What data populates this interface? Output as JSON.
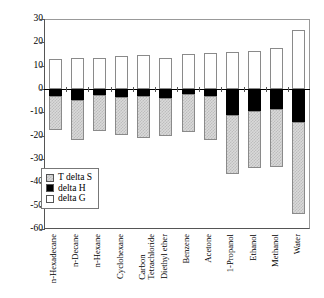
{
  "chart_data": {
    "type": "bar",
    "title": "",
    "xlabel": "",
    "ylabel": "",
    "ylim": [
      -60,
      30
    ],
    "yticks": [
      30,
      20,
      10,
      0,
      -10,
      -20,
      -30,
      -40,
      -50,
      -60
    ],
    "ytick_labels": [
      "30",
      "20",
      "10",
      "0",
      "-10",
      "-20",
      "-30",
      "-40",
      "-50",
      "-60"
    ],
    "grid": false,
    "stacked": true,
    "legend_position": "inside-lower-left",
    "categories": [
      "n-Hexadecane",
      "n-Decane",
      "n-Hexane",
      "Cyclohexane",
      "Carbon\nTetrachloride",
      "Diethyl ether",
      "Benzene",
      "Acetone",
      "1-Propanol",
      "Ethanol",
      "Methanol",
      "Water"
    ],
    "series": [
      {
        "name": "delta G",
        "fill": "white",
        "color": "#ffffff",
        "values": [
          13.0,
          13.4,
          13.3,
          14.2,
          14.4,
          13.4,
          14.8,
          15.5,
          16.0,
          16.5,
          17.4,
          25.5
        ]
      },
      {
        "name": "delta H",
        "fill": "black",
        "color": "#000000",
        "values": [
          -2.8,
          -4.7,
          -2.7,
          -3.4,
          -3.1,
          -4.0,
          -2.2,
          -2.8,
          -11.0,
          -9.3,
          -8.7,
          -14.0
        ]
      },
      {
        "name": "T delta S",
        "fill": "checkered-gray",
        "color": "#d9d9d9",
        "values": [
          -17.4,
          -21.9,
          -17.8,
          -19.7,
          -20.8,
          -20.2,
          -18.4,
          -21.8,
          -36.6,
          -34.0,
          -33.6,
          -53.4
        ]
      }
    ]
  },
  "legend": {
    "items": [
      {
        "label": "T delta S",
        "swatch": "checkered-gray-swatch"
      },
      {
        "label": "delta H",
        "swatch": "black-swatch"
      },
      {
        "label": "delta G",
        "swatch": "white-swatch"
      }
    ]
  }
}
